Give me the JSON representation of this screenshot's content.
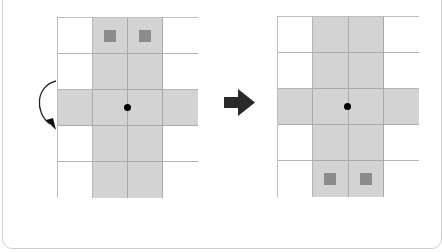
{
  "diagram": {
    "colors": {
      "shaded_cell": "#d3d3d3",
      "empty_cell": "#ffffff",
      "grid_line": "#b5b5b5",
      "marker": "#8b8b8b",
      "pivot": "#000000",
      "arrow": "#222222"
    },
    "before": {
      "rows": 5,
      "cols": 4,
      "shaded": [
        [
          0,
          1,
          1,
          0
        ],
        [
          0,
          1,
          1,
          0
        ],
        [
          1,
          1,
          1,
          1
        ],
        [
          0,
          1,
          1,
          0
        ],
        [
          0,
          1,
          1,
          0
        ]
      ],
      "markers": [
        [
          0,
          1
        ],
        [
          0,
          2
        ]
      ],
      "pivot": "center"
    },
    "after": {
      "rows": 5,
      "cols": 4,
      "shaded": [
        [
          0,
          1,
          1,
          0
        ],
        [
          0,
          1,
          1,
          0
        ],
        [
          1,
          1,
          1,
          1
        ],
        [
          0,
          1,
          1,
          0
        ],
        [
          0,
          1,
          1,
          0
        ]
      ],
      "markers": [
        [
          4,
          1
        ],
        [
          4,
          2
        ]
      ],
      "pivot": "center"
    },
    "rotation_arrow": "counterclockwise-curved-arrow-icon",
    "transition_arrow": "right-arrow-icon"
  }
}
